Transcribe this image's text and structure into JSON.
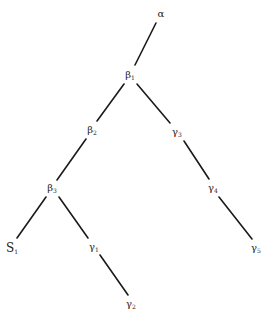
{
  "diagram": {
    "type": "tree",
    "line_color": "#1a1a1a",
    "nodes": [
      {
        "id": "alpha",
        "base": "α",
        "sub": "",
        "x": 161,
        "y": 14
      },
      {
        "id": "beta1",
        "base": "β",
        "sub": "1",
        "x": 130,
        "y": 75
      },
      {
        "id": "beta2",
        "base": "β",
        "sub": "2",
        "x": 92,
        "y": 130
      },
      {
        "id": "gamma3",
        "base": "γ",
        "sub": "3",
        "x": 177,
        "y": 132
      },
      {
        "id": "beta3",
        "base": "β",
        "sub": "3",
        "x": 52,
        "y": 188
      },
      {
        "id": "gamma4",
        "base": "γ",
        "sub": "4",
        "x": 213,
        "y": 188
      },
      {
        "id": "S1",
        "base": "S",
        "sub": "1",
        "x": 12,
        "y": 248
      },
      {
        "id": "gamma1",
        "base": "γ",
        "sub": "1",
        "x": 94,
        "y": 247
      },
      {
        "id": "gamma5",
        "base": "γ",
        "sub": "5",
        "x": 256,
        "y": 248
      },
      {
        "id": "gamma2",
        "base": "γ",
        "sub": "2",
        "x": 131,
        "y": 304
      }
    ],
    "edges": [
      {
        "from": "alpha",
        "to": "beta1",
        "x1": 156,
        "y1": 23,
        "x2": 135,
        "y2": 65
      },
      {
        "from": "beta1",
        "to": "beta2",
        "x1": 124,
        "y1": 84,
        "x2": 97,
        "y2": 121
      },
      {
        "from": "beta1",
        "to": "gamma3",
        "x1": 137,
        "y1": 84,
        "x2": 170,
        "y2": 123
      },
      {
        "from": "beta2",
        "to": "beta3",
        "x1": 86,
        "y1": 139,
        "x2": 57,
        "y2": 180
      },
      {
        "from": "gamma3",
        "to": "gamma4",
        "x1": 184,
        "y1": 141,
        "x2": 209,
        "y2": 179
      },
      {
        "from": "beta3",
        "to": "S1",
        "x1": 46,
        "y1": 197,
        "x2": 17,
        "y2": 238
      },
      {
        "from": "beta3",
        "to": "gamma1",
        "x1": 59,
        "y1": 197,
        "x2": 88,
        "y2": 238
      },
      {
        "from": "gamma4",
        "to": "gamma5",
        "x1": 219,
        "y1": 197,
        "x2": 252,
        "y2": 239
      },
      {
        "from": "gamma1",
        "to": "gamma2",
        "x1": 100,
        "y1": 255,
        "x2": 128,
        "y2": 295
      }
    ]
  },
  "labels": {
    "alpha": "α",
    "beta1": "β",
    "beta1_sub": "1",
    "beta2": "β",
    "beta2_sub": "2",
    "beta3": "β",
    "beta3_sub": "3",
    "gamma1": "γ",
    "gamma1_sub": "1",
    "gamma2": "γ",
    "gamma2_sub": "2",
    "gamma3": "γ",
    "gamma3_sub": "3",
    "gamma4": "γ",
    "gamma4_sub": "4",
    "gamma5": "γ",
    "gamma5_sub": "5",
    "S1": "S",
    "S1_sub": "1"
  }
}
